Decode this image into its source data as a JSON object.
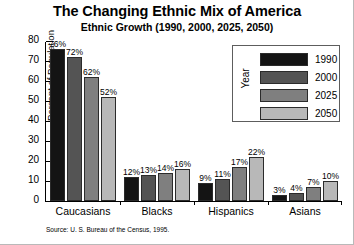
{
  "chart_data": {
    "type": "bar",
    "title": "The Changing Ethnic Mix of America",
    "subtitle": "Ethnic Growth (1990, 2000, 2025, 2050)",
    "xlabel": "",
    "ylabel": "Percent of Population",
    "ylim": [
      0,
      80
    ],
    "yticks": [
      0,
      10,
      20,
      30,
      40,
      50,
      60,
      70,
      80
    ],
    "ytick_labels": [
      "0",
      "10",
      "20",
      "30",
      "40",
      "50",
      "60",
      "70",
      "80"
    ],
    "grid": false,
    "legend_position": "upper right",
    "legend_title": "Year",
    "categories": [
      "Caucasians",
      "Blacks",
      "Hispanics",
      "Asians"
    ],
    "series": [
      {
        "name": "1990",
        "color": "#141414",
        "values": [
          76,
          12,
          9,
          3
        ],
        "data_labels": [
          "76%",
          "12%",
          "9%",
          "3%"
        ]
      },
      {
        "name": "2000",
        "color": "#545454",
        "values": [
          72,
          13,
          11,
          4
        ],
        "data_labels": [
          "72%",
          "13%",
          "11%",
          "4%"
        ]
      },
      {
        "name": "2025",
        "color": "#7f7f7f",
        "values": [
          62,
          14,
          17,
          7
        ],
        "data_labels": [
          "62%",
          "14%",
          "17%",
          "7%"
        ]
      },
      {
        "name": "2050",
        "color": "#b8b8b8",
        "values": [
          52,
          16,
          22,
          10
        ],
        "data_labels": [
          "52%",
          "16%",
          "22%",
          "10%"
        ]
      }
    ],
    "source_note": "Source: U. S. Bureau of the Census, 1995."
  }
}
